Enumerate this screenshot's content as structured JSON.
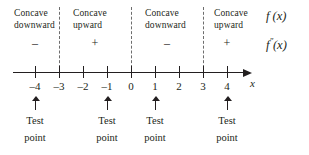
{
  "figure": {
    "axis_variable": "x",
    "colors": {
      "ink": "#231f20",
      "dashed": "#6d6d6d",
      "background": "#ffffff"
    }
  },
  "intervals": [
    {
      "concavity_line1": "Concave",
      "concavity_line2": "downward",
      "sign": "–"
    },
    {
      "concavity_line1": "Concave",
      "concavity_line2": "upward",
      "sign": "+"
    },
    {
      "concavity_line1": "Concave",
      "concavity_line2": "downward",
      "sign": "–"
    },
    {
      "concavity_line1": "Concave",
      "concavity_line2": "upward",
      "sign": "+"
    }
  ],
  "row_labels": {
    "function": "f (x)",
    "second_derivative_base": "f",
    "second_derivative_prime": "″",
    "second_derivative_arg": "(x)"
  },
  "number_line": {
    "ticks": [
      {
        "value": -4,
        "label": "–4"
      },
      {
        "value": -3,
        "label": "–3"
      },
      {
        "value": -2,
        "label": "–2"
      },
      {
        "value": -1,
        "label": "–1"
      },
      {
        "value": 0,
        "label": "0"
      },
      {
        "value": 1,
        "label": "1"
      },
      {
        "value": 2,
        "label": "2"
      },
      {
        "value": 3,
        "label": "3"
      },
      {
        "value": 4,
        "label": "4"
      }
    ],
    "boundaries": [
      -3,
      0,
      3
    ]
  },
  "test_points": [
    {
      "at": -4,
      "line1": "Test",
      "line2": "point"
    },
    {
      "at": -1,
      "line1": "Test",
      "line2": "point"
    },
    {
      "at": 1,
      "line1": "Test",
      "line2": "point"
    },
    {
      "at": 4,
      "line1": "Test",
      "line2": "point"
    }
  ]
}
